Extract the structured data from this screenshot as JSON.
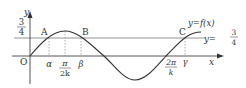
{
  "diagram": {
    "type": "function-graph",
    "colors": {
      "curve": "#333333",
      "axis": "#444444",
      "horizontal_line": "#888888",
      "dotted_guide": "#999999",
      "text": "#333333"
    },
    "axes": {
      "x_label": "x",
      "y_label": "y",
      "origin_label": "O"
    },
    "y_tick": {
      "numerator": "3",
      "denominator": "4"
    },
    "points": [
      {
        "label": "A"
      },
      {
        "label": "B"
      },
      {
        "label": "C"
      }
    ],
    "x_ticks": {
      "alpha": "α",
      "pi_over_2k_num": "π",
      "pi_over_2k_den": "2k",
      "beta": "β",
      "two_pi_over_k_num": "2π",
      "two_pi_over_k_den": "k",
      "gamma": "γ"
    },
    "curve_label": "y=f(x)",
    "line_label": {
      "prefix": "y=",
      "numerator": "3",
      "denominator": "4"
    }
  }
}
